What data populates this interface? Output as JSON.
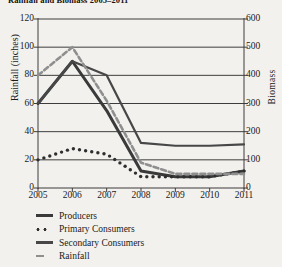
{
  "chart_data": {
    "type": "line",
    "title": "Rainfall and Biomass 2005–2011",
    "xlabel": "",
    "ylabel": "Rainfall (inches)",
    "y2label": "Biomass",
    "x": [
      "2005",
      "2006",
      "2007",
      "2008",
      "2009",
      "2010",
      "2011"
    ],
    "categories": [
      "2005",
      "2006",
      "2007",
      "2008",
      "2009",
      "2010",
      "2011"
    ],
    "ylim": [
      0,
      120
    ],
    "yticks": [
      0,
      20,
      40,
      60,
      80,
      100,
      120
    ],
    "y2lim": [
      0,
      600
    ],
    "y2ticks": [
      0,
      100,
      200,
      300,
      400,
      500,
      600
    ],
    "grid": "horizontal",
    "legend_position": "bottom-left",
    "series": [
      {
        "name": "Producers",
        "axis": "right",
        "style": "solid-thick",
        "color": "#3a3a3a",
        "values": [
          60,
          90,
          55,
          12,
          8,
          8,
          12
        ],
        "values_biomass": [
          300,
          450,
          275,
          60,
          40,
          40,
          60
        ]
      },
      {
        "name": "Primary Consumers",
        "axis": "right",
        "style": "dotted",
        "color": "#2e2e2e",
        "values": [
          20,
          28,
          24,
          8,
          8,
          8,
          12
        ],
        "values_biomass": [
          100,
          140,
          120,
          40,
          40,
          40,
          60
        ]
      },
      {
        "name": "Secondary Consumers",
        "axis": "right",
        "style": "solid-thin",
        "color": "#474747",
        "values": [
          60,
          90,
          80,
          32,
          30,
          30,
          31
        ],
        "values_biomass": [
          300,
          450,
          400,
          160,
          150,
          150,
          155
        ]
      },
      {
        "name": "Rainfall",
        "axis": "left",
        "style": "dashed",
        "color": "#8f8f8f",
        "values": [
          80,
          100,
          62,
          18,
          10,
          10,
          10
        ]
      }
    ]
  },
  "legend": {
    "items": [
      {
        "label": "Producers",
        "swatch": "solid-thick"
      },
      {
        "label": "Primary Consumers",
        "swatch": "dotted"
      },
      {
        "label": "Secondary Consumers",
        "swatch": "solid-thin"
      },
      {
        "label": "Rainfall",
        "swatch": "dashed"
      }
    ]
  }
}
